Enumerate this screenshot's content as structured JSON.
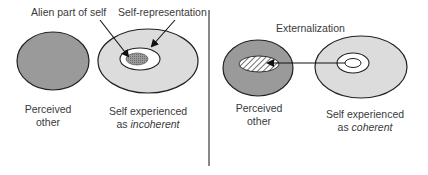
{
  "left_panel": {
    "perceived_other": {
      "line1": "Perceived",
      "line2": "other"
    },
    "self": {
      "line1": "Self experienced",
      "line2_prefix": "as ",
      "line2_italic": "incoherent"
    },
    "callouts": {
      "alien_part": "Alien part of self",
      "self_representation": "Self-representation"
    }
  },
  "right_panel": {
    "arrow_label": "Externalization",
    "perceived_other": {
      "line1": "Perceived",
      "line2": "other"
    },
    "self": {
      "line1": "Self experienced",
      "line2_prefix": "as ",
      "line2_italic": "coherent"
    }
  },
  "colors": {
    "other_fill": "#9a9a9a",
    "self_fill": "#dcdcdc",
    "inner_white": "#ffffff",
    "alien_fill": "#8c8c8c",
    "stroke": "#222222",
    "divider": "#6a6a6a"
  }
}
